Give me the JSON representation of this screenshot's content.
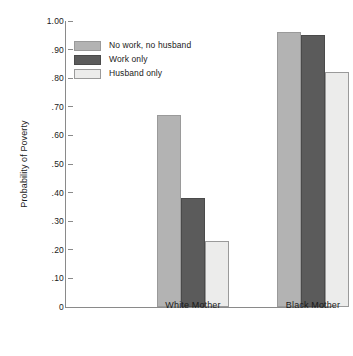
{
  "chart_data": {
    "type": "bar",
    "title": "",
    "xlabel": "",
    "ylabel": "Probability of Poverty",
    "categories": [
      "White Mother",
      "Black Mother"
    ],
    "series": [
      {
        "name": "No work, no husband",
        "color": "#b3b3b3",
        "values": [
          0.67,
          0.96
        ]
      },
      {
        "name": "Work only",
        "color": "#5b5b5b",
        "values": [
          0.38,
          0.95
        ]
      },
      {
        "name": "Husband only",
        "color": "#ececeb",
        "values": [
          0.23,
          0.82
        ]
      }
    ],
    "ylim": [
      0,
      1.0
    ],
    "ytick_values": [
      0,
      0.1,
      0.2,
      0.3,
      0.4,
      0.5,
      0.6,
      0.7,
      0.8,
      0.9,
      1.0
    ],
    "ytick_labels": [
      "0",
      ".10",
      ".20",
      ".30",
      ".40",
      ".50",
      ".60",
      ".70",
      ".80",
      ".90",
      "1.00"
    ],
    "grid": false,
    "legend_position": "upper-left-inside"
  }
}
